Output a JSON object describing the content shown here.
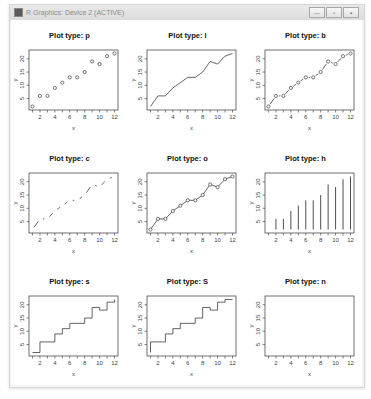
{
  "window": {
    "title": "R Graphics: Device 2 (ACTIVE)",
    "buttons": [
      {
        "name": "minimize",
        "glyph": "—"
      },
      {
        "name": "maximize",
        "glyph": "▫"
      },
      {
        "name": "close",
        "glyph": "▪"
      }
    ]
  },
  "chart_data": {
    "type": "line",
    "layout": "3x3 grid of base R plots of the same data, one per plot type",
    "x": [
      1,
      2,
      3,
      4,
      5,
      6,
      7,
      8,
      9,
      10,
      11,
      12
    ],
    "y": [
      2,
      6,
      6,
      9,
      11,
      13,
      13,
      15,
      19,
      18,
      21,
      22
    ],
    "xlabel": "x",
    "ylabel": "y",
    "xticks": [
      2,
      4,
      6,
      8,
      10,
      12
    ],
    "yticks": [
      5,
      10,
      15,
      20
    ],
    "xlim": [
      1,
      12
    ],
    "ylim": [
      2,
      22
    ],
    "grid": false,
    "legend": null,
    "panels": [
      {
        "type": "p",
        "title": "Plot type: p",
        "desc": "points"
      },
      {
        "type": "l",
        "title": "Plot type: l",
        "desc": "lines"
      },
      {
        "type": "b",
        "title": "Plot type: b",
        "desc": "both points and lines"
      },
      {
        "type": "c",
        "title": "Plot type: c",
        "desc": "lines part of b"
      },
      {
        "type": "o",
        "title": "Plot type: o",
        "desc": "overplotted"
      },
      {
        "type": "h",
        "title": "Plot type: h",
        "desc": "histogram-like vertical lines"
      },
      {
        "type": "s",
        "title": "Plot type: s",
        "desc": "stair steps"
      },
      {
        "type": "S",
        "title": "Plot type: S",
        "desc": "other steps"
      },
      {
        "type": "n",
        "title": "Plot type: n",
        "desc": "no plotting"
      }
    ]
  },
  "colors": {
    "ink": "#222222",
    "frame": "#333333",
    "title": "#111111",
    "axis_text": "#444444"
  }
}
